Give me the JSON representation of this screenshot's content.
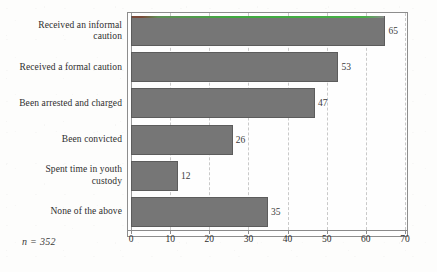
{
  "chart_data": {
    "type": "bar",
    "orientation": "horizontal",
    "title": "",
    "xlabel": "",
    "ylabel": "",
    "categories": [
      "Received an informal caution",
      "Received a formal caution",
      "Been arrested and charged",
      "Been convicted",
      "Spent time in youth custody",
      "None of the above"
    ],
    "category_lines": [
      [
        "Received an informal",
        "caution"
      ],
      [
        "Received a formal caution"
      ],
      [
        "Been arrested and charged"
      ],
      [
        "Been convicted"
      ],
      [
        "Spent time in youth",
        "custody"
      ],
      [
        "None of the above"
      ]
    ],
    "values": [
      65,
      53,
      47,
      26,
      12,
      35
    ],
    "value_labels": [
      "65",
      "53",
      "47",
      "26",
      "12",
      "35"
    ],
    "xlim": [
      0,
      70
    ],
    "xticks": [
      0,
      10,
      20,
      30,
      40,
      50,
      60,
      70
    ],
    "xtick_labels": [
      "0",
      "10",
      "20",
      "30",
      "40",
      "50",
      "60",
      "70"
    ],
    "grid": "vertical-dashed",
    "legend": "none",
    "annotation": "n = 352",
    "bar_color": "#767676",
    "bar_edge_color": "#5c5c5c",
    "grid_color": "#c9c9c9",
    "axis_color": "#8a8a8a",
    "text_color": "#2e2e2e",
    "background_color": "#fdfdfc"
  }
}
